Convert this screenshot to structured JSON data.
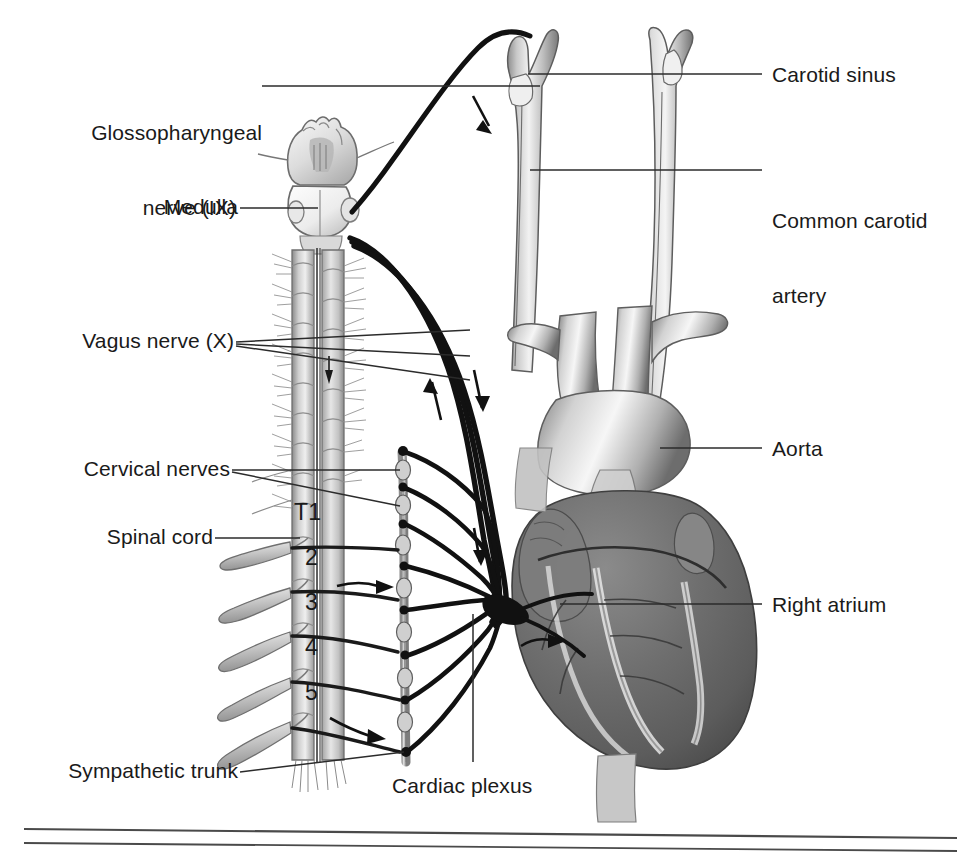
{
  "figure": {
    "background_color": "#ffffff",
    "ink_color": "#1a1a1a",
    "width": 979,
    "height": 861
  },
  "labels": {
    "glossopharyngeal": {
      "line1": "Glossopharyngeal",
      "line2": "nerve (IX)"
    },
    "medulla": "Medulla",
    "vagus": "Vagus nerve (X)",
    "cervical_nerves": "Cervical nerves",
    "spinal_cord": "Spinal cord",
    "sympathetic_trunk": "Sympathetic trunk",
    "cardiac_plexus": "Cardiac plexus",
    "carotid_sinus": "Carotid sinus",
    "common_carotid": {
      "line1": "Common carotid",
      "line2": "artery"
    },
    "aorta": "Aorta",
    "right_atrium": "Right atrium"
  },
  "spinal_segments": [
    {
      "text": "T1"
    },
    {
      "text": "2"
    },
    {
      "text": "3"
    },
    {
      "text": "4"
    },
    {
      "text": "5"
    }
  ],
  "colors": {
    "ink": "#1a1a1a",
    "leader": "#2b2b2b",
    "nerve": "#111111",
    "vessel_light": "#d8d8d8",
    "vessel_mid": "#9a9a9a",
    "vessel_dark": "#6b6b6b",
    "heart_muscle": "#6e6e6e",
    "heart_dark": "#4a4a4a",
    "cord_light": "#e2e2e2",
    "cord_mid": "#a8a8a8",
    "bone": "#c9c9c9",
    "rule": "#4a4a4a"
  },
  "rules": [
    {
      "name": "lower-rule-top"
    },
    {
      "name": "lower-rule-bottom"
    }
  ]
}
